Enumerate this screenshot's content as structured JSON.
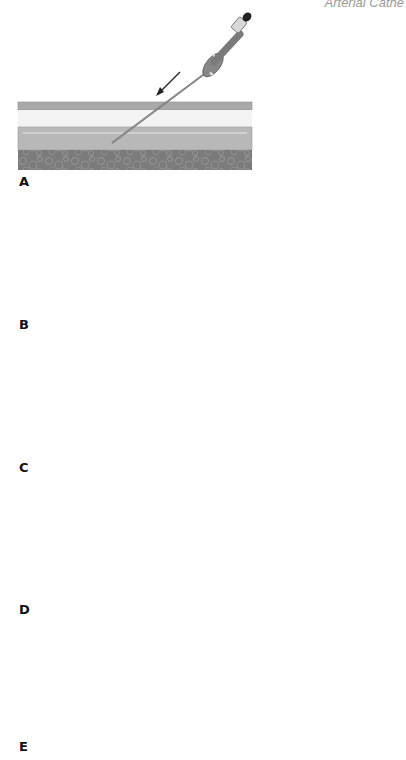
{
  "header": {
    "title": "Arterial Cathe"
  },
  "colors": {
    "epidermis": "#a9a9a9",
    "dermis": "#f2f2f2",
    "vessel": "#b9b9b9",
    "vessel_highlight": "#d8d8d8",
    "muscle": "#7d7d7d",
    "needle": "#6e6e6e",
    "hub": "#858585",
    "guidewire": "#151515",
    "catheter": "#ffffff"
  },
  "panels": [
    {
      "label": "A",
      "description": "Needle inserted at an angle through skin into artery"
    },
    {
      "label": "B",
      "description": "Stylet removed; blood flashback from hub"
    },
    {
      "label": "C",
      "description": "Guidewire advanced through needle into artery"
    },
    {
      "label": "D",
      "description": "Needle withdrawn over guidewire while compressing site"
    },
    {
      "label": "E",
      "description": "Catheter threaded over guidewire with twisting motion"
    }
  ]
}
